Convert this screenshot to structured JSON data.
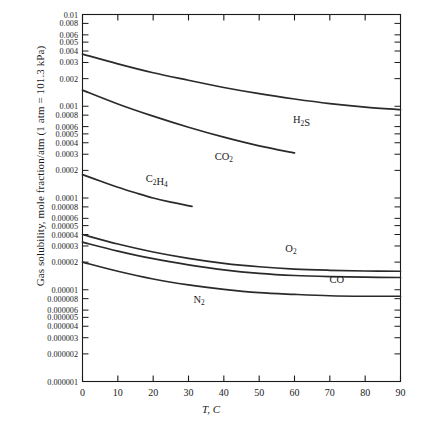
{
  "chart_data": {
    "type": "line",
    "title": "",
    "xlabel": "T, C",
    "ylabel": "Gas solubility, mole fraction/atm (1 atm = 101.3 kPa)",
    "xlim": [
      0,
      90
    ],
    "ylim": [
      1e-06,
      0.01
    ],
    "yscale": "log",
    "xscale": "linear",
    "grid": false,
    "legend_position": "inline-labels",
    "xticks": [
      0,
      10,
      20,
      30,
      40,
      50,
      60,
      70,
      80,
      90
    ],
    "xticklabels": [
      "0",
      "10",
      "20",
      "30",
      "40",
      "50",
      "60",
      "70",
      "80",
      "90"
    ],
    "yticks": [
      0.01,
      0.008,
      0.006,
      0.005,
      0.004,
      0.003,
      0.002,
      0.001,
      0.0008,
      0.0006,
      0.0005,
      0.0004,
      0.0003,
      0.0002,
      0.0001,
      8e-05,
      6e-05,
      5e-05,
      4e-05,
      3e-05,
      2e-05,
      1e-05,
      8e-06,
      6e-06,
      5e-06,
      4e-06,
      3e-06,
      2e-06,
      1e-06
    ],
    "yticklabels": [
      "0.01",
      "0.008",
      "0.006",
      "0.005",
      "0.004",
      "0.003",
      "0.002",
      "0.001",
      "0.0008",
      "0.0006",
      "0.0005",
      "0.0004",
      "0.0003",
      "0.0002",
      "0.0001",
      "0.00008",
      "0.00006",
      "0.00005",
      "0.00004",
      "0.00003",
      "0.00002",
      "0.00001",
      "0.000008",
      "0.000006",
      "0.000005",
      "0.000004",
      "0.000003",
      "0.000002",
      "0.000001"
    ],
    "series": [
      {
        "name": "H2S",
        "label": "H₂S",
        "label_at": [
          62,
          0.00065
        ],
        "x": [
          0,
          10,
          20,
          30,
          40,
          50,
          60,
          70,
          80,
          90
        ],
        "y": [
          0.0037,
          0.0029,
          0.00232,
          0.00192,
          0.0016,
          0.00137,
          0.0012,
          0.00107,
          0.00098,
          0.00092
        ]
      },
      {
        "name": "CO2",
        "label": "CO₂",
        "label_at": [
          40,
          0.00026
        ],
        "x": [
          0,
          10,
          20,
          30,
          40,
          50,
          60
        ],
        "y": [
          0.0015,
          0.00106,
          0.00078,
          0.00059,
          0.00046,
          0.00037,
          0.00031
        ]
      },
      {
        "name": "C2H4",
        "label": "C₂H₄",
        "label_at": [
          21,
          0.000148
        ],
        "x": [
          0,
          5,
          10,
          15,
          20,
          25,
          31
        ],
        "y": [
          0.00018,
          0.000153,
          0.000131,
          0.000114,
          0.0001,
          9e-05,
          8.1e-05
        ]
      },
      {
        "name": "O2",
        "label": "O₂",
        "label_at": [
          59,
          2.6e-05
        ],
        "x": [
          0,
          10,
          20,
          30,
          40,
          50,
          60,
          70,
          80,
          90
        ],
        "y": [
          4e-05,
          3.15e-05,
          2.58e-05,
          2.2e-05,
          1.94e-05,
          1.78e-05,
          1.68e-05,
          1.63e-05,
          1.6e-05,
          1.59e-05
        ]
      },
      {
        "name": "CO",
        "label": "CO",
        "label_at": [
          72,
          1.17e-05
        ],
        "x": [
          0,
          10,
          20,
          30,
          40,
          50,
          60,
          70,
          80,
          90
        ],
        "y": [
          3.3e-05,
          2.64e-05,
          2.18e-05,
          1.87e-05,
          1.65e-05,
          1.51e-05,
          1.43e-05,
          1.39e-05,
          1.37e-05,
          1.36e-05
        ]
      },
      {
        "name": "N2",
        "label": "N₂",
        "label_at": [
          33,
          7.2e-06
        ],
        "x": [
          0,
          10,
          20,
          30,
          40,
          50,
          60,
          70,
          80,
          90
        ],
        "y": [
          2e-05,
          1.59e-05,
          1.31e-05,
          1.13e-05,
          1.01e-05,
          9.3e-06,
          8.9e-06,
          8.6e-06,
          8.5e-06,
          8.5e-06
        ]
      }
    ]
  },
  "axis_titles": {
    "y": "Gas solubility, mole fraction/atm (1 atm = 101.3 kPa)",
    "x_symbol": "T",
    "x_sep": ",",
    "x_unit": "C"
  }
}
